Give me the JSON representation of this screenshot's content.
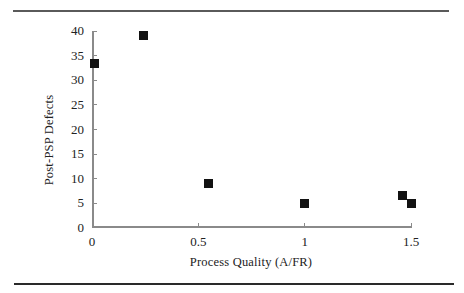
{
  "chart_data": {
    "type": "scatter",
    "title": "",
    "xlabel": "Process Quality (A/FR)",
    "ylabel": "Post-PSP Defects",
    "xlim": [
      0,
      1.5
    ],
    "ylim": [
      0,
      40
    ],
    "x_ticks": [
      0,
      0.5,
      1,
      1.5
    ],
    "x_tick_labels": [
      "0",
      "0.5",
      "1",
      "1.5"
    ],
    "y_ticks": [
      0,
      5,
      10,
      15,
      20,
      25,
      30,
      35,
      40
    ],
    "y_tick_labels": [
      "0",
      "5",
      "10",
      "15",
      "20",
      "25",
      "30",
      "35",
      "40"
    ],
    "points": [
      {
        "x": 0.01,
        "y": 33.5
      },
      {
        "x": 0.24,
        "y": 39
      },
      {
        "x": 0.55,
        "y": 9
      },
      {
        "x": 1.0,
        "y": 5
      },
      {
        "x": 1.46,
        "y": 6.5
      },
      {
        "x": 1.5,
        "y": 5
      }
    ],
    "marker": "filled-square",
    "grid": false,
    "legend": null
  },
  "styles": {
    "background": "#ffffff",
    "axis_color": "#8a8a8a",
    "text_color": "#222222",
    "marker_color": "#121212",
    "rule_top_color": "#5a5a5a",
    "rule_bottom_color": "#2a2a2a"
  }
}
